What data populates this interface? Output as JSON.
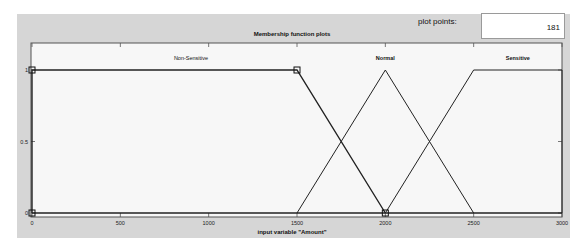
{
  "controls": {
    "plot_points_label": "plot points:",
    "plot_points_value": "181"
  },
  "chart_data": {
    "type": "line",
    "title": "Membership function plots",
    "xlabel": "input variable \"Amount\"",
    "ylabel": "",
    "xlim": [
      0,
      3000
    ],
    "ylim": [
      0,
      1
    ],
    "xticks": [
      0,
      500,
      1000,
      1500,
      2000,
      2500,
      3000
    ],
    "yticks": [
      0,
      0.5,
      1
    ],
    "grid": false,
    "legend": "none (labels placed above each curve)",
    "series": [
      {
        "name": "Non-Sensitive",
        "shape": "trapezoid",
        "x": [
          0,
          0,
          1500,
          2000
        ],
        "y": [
          0,
          1,
          1,
          0
        ],
        "params": [
          0,
          0,
          1500,
          2000
        ],
        "highlighted": true
      },
      {
        "name": "Normal",
        "shape": "triangle",
        "x": [
          1500,
          2000,
          2500
        ],
        "y": [
          0,
          1,
          0
        ],
        "params": [
          1500,
          2000,
          2500
        ]
      },
      {
        "name": "Sensitive",
        "shape": "trapezoid",
        "x": [
          2000,
          2500,
          3000,
          3000
        ],
        "y": [
          0,
          1,
          1,
          0
        ],
        "params": [
          2000,
          2500,
          3000,
          3000
        ]
      }
    ],
    "curve_labels": [
      {
        "text": "Non-Sensitive",
        "x": 900
      },
      {
        "text": "Normal",
        "x": 2000
      },
      {
        "text": "Sensitive",
        "x": 2750
      }
    ]
  }
}
